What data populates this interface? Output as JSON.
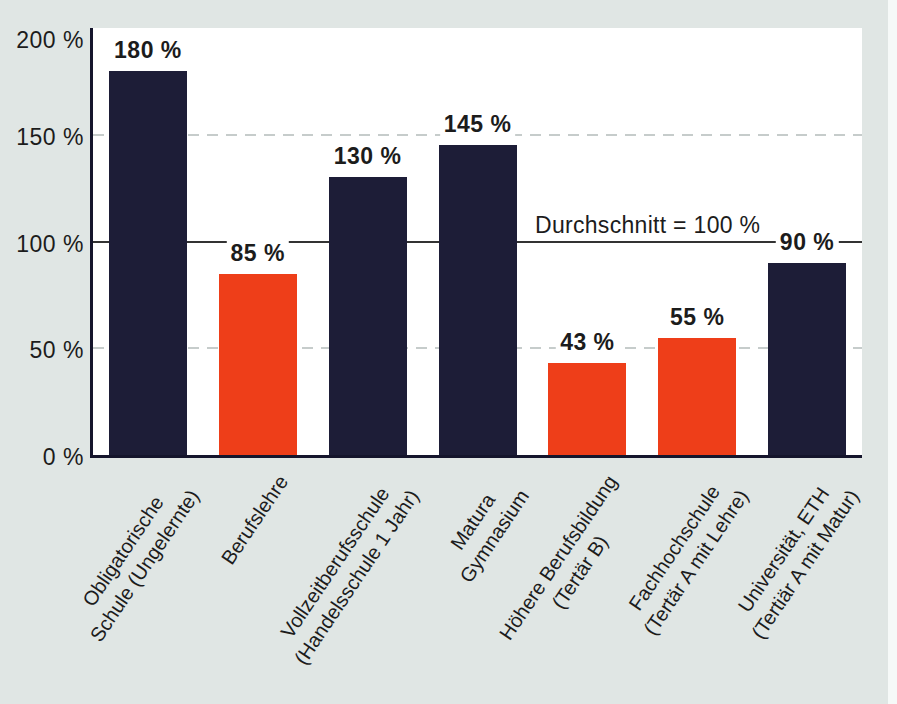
{
  "chart_data": {
    "type": "bar",
    "title": "",
    "unit": "%",
    "categories": [
      [
        "Obligatorische",
        "Schule (Ungelernte)"
      ],
      [
        "Berufslehre"
      ],
      [
        "Vollzeitberufsschule",
        "(Handelsschule 1 Jahr)"
      ],
      [
        "Matura",
        "Gymnasium"
      ],
      [
        "Höhere Berufsbildung",
        "(Tertär B)"
      ],
      [
        "Fachhochschule",
        "(Tertär A mit Lehre)"
      ],
      [
        "Universität, ETH",
        "(Tertiär A mit Matur)"
      ]
    ],
    "values": [
      180,
      85,
      130,
      145,
      43,
      55,
      90
    ],
    "value_labels": [
      "180 %",
      "85 %",
      "130 %",
      "145 %",
      "43 %",
      "55 %",
      "90 %"
    ],
    "bar_color_keys": [
      "dark",
      "accent",
      "dark",
      "dark",
      "accent",
      "accent",
      "dark"
    ],
    "ylim": [
      0,
      200
    ],
    "yticks": [
      {
        "value": 200,
        "label": "200 %"
      },
      {
        "value": 150,
        "label": "150 %"
      },
      {
        "value": 100,
        "label": "100 %"
      },
      {
        "value": 50,
        "label": "50 %"
      },
      {
        "value": 0,
        "label": "0 %"
      }
    ],
    "gridlines": {
      "dashed_at": [
        150,
        50
      ],
      "solid_at": [
        100
      ]
    },
    "annotation": {
      "text": "Durchschnitt = 100 %",
      "at_value": 100
    },
    "legend": "none",
    "grid": "horizontal-only",
    "colors": {
      "dark": "#1d1d37",
      "accent": "#ee3e19",
      "axis": "#15152c",
      "solid_line": "#333333",
      "dashed_line": "#c6cccb",
      "text": "#1c1c1c",
      "plot_bg": "#ffffff",
      "page_bg": "#e0e6e4"
    }
  }
}
